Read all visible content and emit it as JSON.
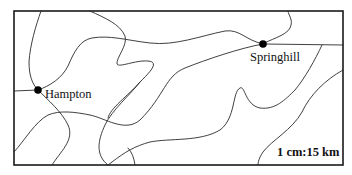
{
  "map": {
    "cities": [
      {
        "name": "Springhill",
        "x": 263,
        "y": 44
      },
      {
        "name": "Hampton",
        "x": 38,
        "y": 90
      }
    ],
    "scale": "1 cm:15 km",
    "colors": {
      "line": "#2a2a2a",
      "frame": "#1a1a1a",
      "dot": "#000000",
      "background": "#ffffff"
    }
  }
}
